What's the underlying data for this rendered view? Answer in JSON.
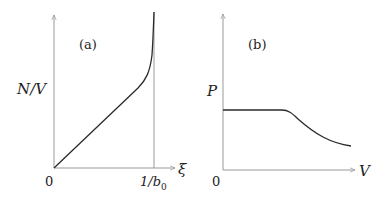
{
  "panels": [
    {
      "tag": "(a)",
      "ylabel": "N/V",
      "xlabel": "ξ",
      "origin": "0",
      "xtick": "1/b",
      "xtick_sub": "0"
    },
    {
      "tag": "(b)",
      "ylabel": "P",
      "xlabel": "V",
      "origin": "0"
    }
  ],
  "colors": {
    "axis": "#999999",
    "curve": "#2a2a2a",
    "text": "#222222"
  }
}
